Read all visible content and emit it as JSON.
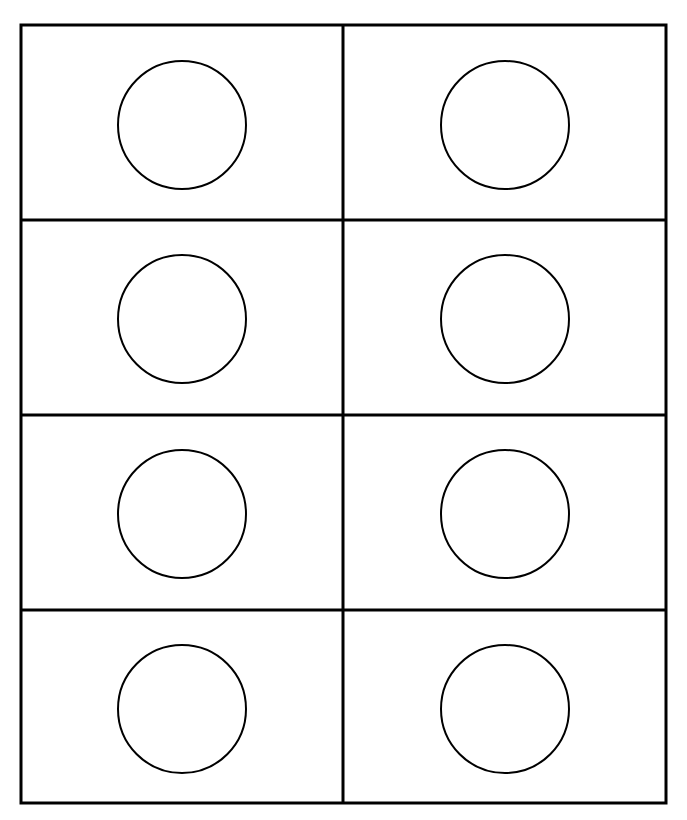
{
  "canvas": {
    "width": 687,
    "height": 820,
    "background": "#ffffff"
  },
  "grid": {
    "rows": 4,
    "cols": 2,
    "stroke": "#000000",
    "outer_stroke_width": 3,
    "inner_stroke_width": 3,
    "x": 21,
    "y": 25,
    "width": 645,
    "height": 778,
    "col_divider_x": 343,
    "row_divider_y": [
      220,
      415,
      610
    ]
  },
  "cells": [
    {
      "row": 0,
      "col": 0,
      "shape": "circle",
      "cx": 182,
      "cy": 125,
      "r": 64
    },
    {
      "row": 0,
      "col": 1,
      "shape": "circle",
      "cx": 505,
      "cy": 125,
      "r": 64
    },
    {
      "row": 1,
      "col": 0,
      "shape": "circle",
      "cx": 182,
      "cy": 319,
      "r": 64
    },
    {
      "row": 1,
      "col": 1,
      "shape": "circle",
      "cx": 505,
      "cy": 319,
      "r": 64
    },
    {
      "row": 2,
      "col": 0,
      "shape": "circle",
      "cx": 182,
      "cy": 514,
      "r": 64
    },
    {
      "row": 2,
      "col": 1,
      "shape": "circle",
      "cx": 505,
      "cy": 514,
      "r": 64
    },
    {
      "row": 3,
      "col": 0,
      "shape": "circle",
      "cx": 182,
      "cy": 709,
      "r": 64
    },
    {
      "row": 3,
      "col": 1,
      "shape": "circle",
      "cx": 505,
      "cy": 709,
      "r": 64
    }
  ],
  "circle_style": {
    "stroke": "#000000",
    "stroke_width": 2,
    "fill": "none"
  }
}
